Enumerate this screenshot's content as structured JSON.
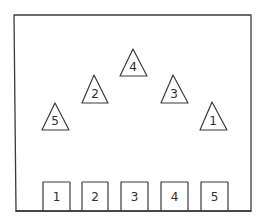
{
  "diagram": {
    "frame": {
      "x1": 14,
      "y1": 15,
      "x2": 251,
      "y2": 211
    },
    "stroke_color": "#3a3a3a",
    "triangles": [
      {
        "label": "5",
        "apex": [
          55,
          103
        ],
        "base_y": 130,
        "base_x": [
          42,
          69
        ]
      },
      {
        "label": "2",
        "apex": [
          94,
          75
        ],
        "base_y": 103,
        "base_x": [
          82,
          108
        ]
      },
      {
        "label": "4",
        "apex": [
          133,
          49
        ],
        "base_y": 76,
        "base_x": [
          120,
          147
        ]
      },
      {
        "label": "3",
        "apex": [
          173,
          75
        ],
        "base_y": 103,
        "base_x": [
          161,
          188
        ]
      },
      {
        "label": "1",
        "apex": [
          212,
          102
        ],
        "base_y": 130,
        "base_x": [
          200,
          227
        ]
      }
    ],
    "boxes": [
      {
        "label": "1",
        "x": 43,
        "y": 182,
        "w": 27,
        "h": 29
      },
      {
        "label": "2",
        "x": 82,
        "y": 182,
        "w": 26,
        "h": 29
      },
      {
        "label": "3",
        "x": 121,
        "y": 182,
        "w": 27,
        "h": 29
      },
      {
        "label": "4",
        "x": 161,
        "y": 182,
        "w": 27,
        "h": 29
      },
      {
        "label": "5",
        "x": 201,
        "y": 182,
        "w": 27,
        "h": 29
      }
    ]
  }
}
